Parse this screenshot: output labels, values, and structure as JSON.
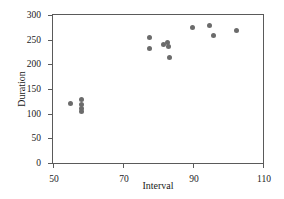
{
  "chart_data": {
    "type": "scatter",
    "title": "",
    "xlabel": "Interval",
    "ylabel": "Duration",
    "xlim": [
      50,
      110
    ],
    "ylim": [
      0,
      300
    ],
    "xticks": [
      50,
      70,
      90,
      110
    ],
    "yticks": [
      0,
      50,
      100,
      150,
      200,
      250,
      300
    ],
    "grid": false,
    "legend": null,
    "marker_color": "#6b6b6b",
    "axis_color": "#5a5a5a",
    "series": [
      {
        "name": "Old Faithful eruptions",
        "points": [
          {
            "x": 55.1,
            "y": 120
          },
          {
            "x": 58.0,
            "y": 128
          },
          {
            "x": 58.0,
            "y": 118
          },
          {
            "x": 58.0,
            "y": 110
          },
          {
            "x": 58.0,
            "y": 104
          },
          {
            "x": 77.6,
            "y": 254
          },
          {
            "x": 77.6,
            "y": 232
          },
          {
            "x": 81.6,
            "y": 240
          },
          {
            "x": 82.6,
            "y": 244
          },
          {
            "x": 83.1,
            "y": 236
          },
          {
            "x": 83.3,
            "y": 214
          },
          {
            "x": 89.8,
            "y": 274
          },
          {
            "x": 94.6,
            "y": 278
          },
          {
            "x": 95.9,
            "y": 258
          },
          {
            "x": 102.3,
            "y": 268
          }
        ]
      }
    ]
  }
}
